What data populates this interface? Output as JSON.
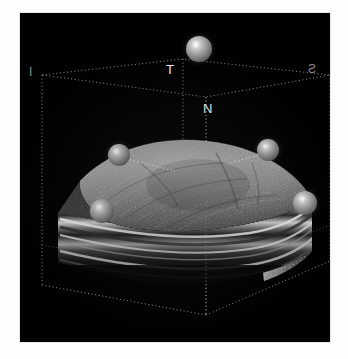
{
  "image": {
    "kind": "oct-3d-volume-render",
    "background_color": "#010101",
    "page_background": "#ffffff",
    "viewport": {
      "x": 20,
      "y": 13,
      "width": 310,
      "height": 329
    }
  },
  "quadrant_labels": [
    {
      "id": "temporal",
      "text": "T",
      "x": 146,
      "y": 56,
      "tone": "bright"
    },
    {
      "id": "nasal",
      "text": "N",
      "x": 183,
      "y": 95,
      "tone": "bright"
    },
    {
      "id": "inferior",
      "text": "I",
      "x": 30,
      "y": 70,
      "tone": "dim"
    },
    {
      "id": "superior",
      "text": "S",
      "x": 310,
      "y": 67,
      "tone": "dim"
    }
  ],
  "markers": [
    {
      "id": "marker-apex",
      "cx": 179,
      "cy": 36,
      "r": 13
    },
    {
      "id": "marker-left-upper",
      "cx": 99,
      "cy": 142,
      "r": 11
    },
    {
      "id": "marker-right-upper",
      "cx": 248,
      "cy": 137,
      "r": 11
    },
    {
      "id": "marker-left-lower",
      "cx": 82,
      "cy": 198,
      "r": 12
    },
    {
      "id": "marker-right-lower",
      "cx": 285,
      "cy": 190,
      "r": 12
    }
  ],
  "leader_lines": [
    {
      "id": "leader-left",
      "x1": 110,
      "y1": 147,
      "x2": 155,
      "y2": 158
    },
    {
      "id": "leader-right",
      "x1": 238,
      "y1": 142,
      "x2": 208,
      "y2": 151
    }
  ],
  "wireframe": {
    "color": "#b9b9b9",
    "style": "dotted",
    "top_face": [
      [
        22,
        62
      ],
      [
        163,
        46
      ],
      [
        310,
        62
      ],
      [
        186,
        84
      ],
      [
        22,
        62
      ]
    ],
    "front_top": [
      [
        22,
        62
      ],
      [
        22,
        272
      ]
    ],
    "right_top": [
      [
        310,
        62
      ],
      [
        310,
        248
      ]
    ],
    "mid_vert": [
      [
        163,
        46
      ],
      [
        163,
        262
      ]
    ],
    "axis_vert": [
      [
        186,
        84
      ],
      [
        186,
        300
      ]
    ],
    "bottom": [
      [
        22,
        272
      ],
      [
        186,
        330
      ],
      [
        330,
        248
      ]
    ],
    "inner_floor": [
      [
        22,
        232
      ],
      [
        186,
        292
      ],
      [
        330,
        212
      ]
    ]
  },
  "colors": {
    "wire": "#b9b9b9",
    "label_bright": "#f2f2f2",
    "label_dim": "#8d8d8d",
    "sphere_highlight": "#ffffff",
    "sphere_body": "#9a9a9a"
  }
}
